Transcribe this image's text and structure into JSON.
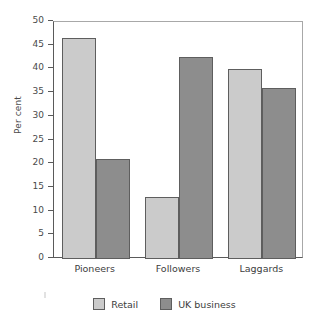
{
  "chart_data": {
    "type": "bar",
    "title": "",
    "subtitle": "",
    "xlabel": "",
    "ylabel": "Per cent",
    "categories": [
      "Pioneers",
      "Followers",
      "Laggards"
    ],
    "series": [
      {
        "name": "Retail",
        "color": "#cbcbcb",
        "values": [
          46.7,
          13.0,
          40.0
        ]
      },
      {
        "name": "UK business",
        "color": "#8d8d8d",
        "values": [
          21.0,
          42.7,
          36.0
        ]
      }
    ],
    "ylim": [
      0,
      50
    ],
    "ytick_step": 5,
    "ytick_labels": [
      "0",
      "5",
      "10",
      "15",
      "20",
      "25",
      "30",
      "35",
      "40",
      "45",
      "50"
    ],
    "grid": false,
    "legend_position": "bottom",
    "axis_color": "#5a5a5a",
    "frame_color": "#a8a8a8",
    "bar_edge_color": "#5e5e5e",
    "background": "#ffffff"
  }
}
